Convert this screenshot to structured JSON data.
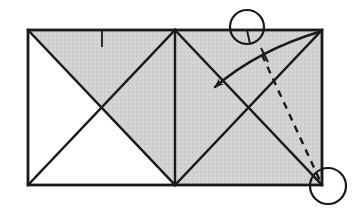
{
  "figure": {
    "type": "origami-crease-diagram",
    "canvas": {
      "width": 358,
      "height": 210,
      "background": "#ffffff"
    },
    "colors": {
      "line": "#1a1a1a",
      "shade": "#d2d2d2",
      "paper": "#ffffff",
      "arrow": "#1a1a1a",
      "dashed": "#1a1a1a"
    },
    "paper": {
      "name": "rectangle-sheet",
      "left": 28,
      "top": 30,
      "right": 322,
      "bottom": 185,
      "stroke_width": 2.4
    },
    "shaded_regions": [
      {
        "name": "upper-left-shaded-triangle",
        "points": "28,30 175,30 175,185 101.5,108"
      },
      {
        "name": "right-half-shaded-square",
        "points": "175,30 322,30 322,185 175,185"
      }
    ],
    "white_regions": [
      {
        "name": "lower-left-white-triangle",
        "points": "28,30 101.5,108 28,185"
      },
      {
        "name": "bottom-left-white-triangle",
        "points": "28,185 101.5,108 175,185"
      }
    ],
    "crease_lines": [
      {
        "name": "crease-left-diagonal-down",
        "x1": 28,
        "y1": 30,
        "x2": 175,
        "y2": 185
      },
      {
        "name": "crease-left-diagonal-up",
        "x1": 28,
        "y1": 185,
        "x2": 175,
        "y2": 30
      },
      {
        "name": "crease-center-vertical",
        "x1": 175,
        "y1": 30,
        "x2": 175,
        "y2": 185
      },
      {
        "name": "crease-right-diagonal-down",
        "x1": 175,
        "y1": 30,
        "x2": 322,
        "y2": 185
      },
      {
        "name": "crease-right-diagonal-up",
        "x1": 175,
        "y1": 185,
        "x2": 322,
        "y2": 30
      }
    ],
    "tick_marks": [
      {
        "name": "top-edge-reference-tick",
        "x1": 102,
        "y1": 31,
        "x2": 102,
        "y2": 47
      },
      {
        "name": "circled-landmark-tick",
        "x1": 247,
        "y1": 30,
        "x2": 250,
        "y2": 44
      },
      {
        "name": "arrow-crossing-tick",
        "x1": 261,
        "y1": 48,
        "x2": 268,
        "y2": 62
      }
    ],
    "dashed_fold": {
      "name": "dashed-fold-line",
      "x1": 262,
      "y1": 55,
      "x2": 322,
      "y2": 185,
      "dash_pattern": "7 6",
      "stroke_width": 2.4
    },
    "fold_arrow": {
      "name": "fold-direction-arrow",
      "start_x": 322,
      "start_y": 31,
      "end_x": 213,
      "end_y": 88,
      "control_x": 258,
      "control_y": 50,
      "head_size": 13,
      "stroke_width": 2.4,
      "description": "curved arrow from top-right corner pointing down-left"
    },
    "highlight_circles": [
      {
        "name": "top-landmark-circle",
        "cx": 247,
        "cy": 27,
        "r": 17,
        "stroke_width": 2.2
      },
      {
        "name": "bottom-right-corner-circle",
        "cx": 328,
        "cy": 186,
        "r": 18,
        "stroke_width": 2.2
      }
    ]
  }
}
